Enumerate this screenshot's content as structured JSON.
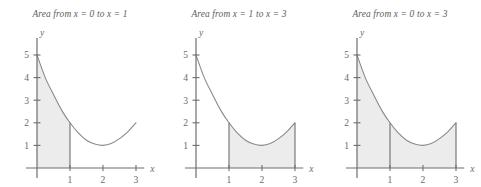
{
  "figure": {
    "background_color": "#ffffff",
    "axis_color": "#6e6e6e",
    "curve_color": "#8a8a8a",
    "shade_color": "#ececec",
    "shade_edge_color": "#6e6e6e",
    "text_color": "#5c5c5c"
  },
  "panels": [
    {
      "title": "Area from x = 0 to x = 1",
      "shade_from": 0,
      "shade_to": 1,
      "boundary_lines": [
        1
      ],
      "x_axis_label": "x",
      "y_axis_label": "y",
      "x_ticks": [
        1,
        2,
        3
      ],
      "x_tick_labels": [
        "1",
        "2",
        "3"
      ],
      "y_ticks": [
        1,
        2,
        3,
        4,
        5
      ],
      "y_tick_labels": [
        "1",
        "2",
        "3",
        "4",
        "5"
      ]
    },
    {
      "title": "Area from x = 1 to x = 3",
      "shade_from": 1,
      "shade_to": 3,
      "boundary_lines": [
        1,
        3
      ],
      "x_axis_label": "x",
      "y_axis_label": "y",
      "x_ticks": [
        1,
        2,
        3
      ],
      "x_tick_labels": [
        "1",
        "2",
        "3"
      ],
      "y_ticks": [
        1,
        2,
        3,
        4,
        5
      ],
      "y_tick_labels": [
        "1",
        "2",
        "3",
        "4",
        "5"
      ]
    },
    {
      "title": "Area from x = 0 to x = 3",
      "shade_from": 0,
      "shade_to": 3,
      "boundary_lines": [
        1,
        3
      ],
      "x_axis_label": "x",
      "y_axis_label": "y",
      "x_ticks": [
        1,
        2,
        3
      ],
      "x_tick_labels": [
        "1",
        "2",
        "3"
      ],
      "y_ticks": [
        1,
        2,
        3,
        4,
        5
      ],
      "y_tick_labels": [
        "1",
        "2",
        "3",
        "4",
        "5"
      ]
    }
  ],
  "chart_data": {
    "type": "area",
    "xlabel": "x",
    "ylabel": "y",
    "xlim": [
      0,
      3.2
    ],
    "ylim": [
      0,
      5.6
    ],
    "grid": false,
    "legend": "none",
    "x_ticks": [
      1,
      2,
      3
    ],
    "y_ticks": [
      1,
      2,
      3,
      4,
      5
    ],
    "series": [
      {
        "name": "f(x)",
        "x": [
          0.0,
          0.25,
          0.5,
          0.75,
          1.0,
          1.25,
          1.5,
          1.75,
          2.0,
          2.25,
          2.5,
          2.75,
          3.0
        ],
        "y": [
          5.0,
          4.0,
          3.25,
          2.55,
          2.0,
          1.55,
          1.23,
          1.06,
          1.0,
          1.08,
          1.3,
          1.6,
          2.0
        ]
      }
    ],
    "key_points": [
      {
        "label": "start",
        "x": 0,
        "y": 5
      },
      {
        "label": "at x = 1",
        "x": 1,
        "y": 2
      },
      {
        "label": "minimum",
        "x": 2,
        "y": 1
      },
      {
        "label": "at x = 3",
        "x": 3,
        "y": 2
      }
    ],
    "shaded_regions": [
      {
        "panel": 1,
        "from": 0,
        "to": 1
      },
      {
        "panel": 2,
        "from": 1,
        "to": 3
      },
      {
        "panel": 3,
        "from": 0,
        "to": 3
      }
    ]
  }
}
